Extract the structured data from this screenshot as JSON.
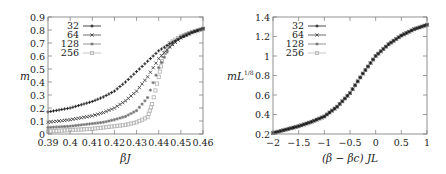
{
  "chart_data": [
    {
      "type": "scatter",
      "title": "",
      "xlabel": "βJ",
      "ylabel": "m",
      "xlim": [
        0.39,
        0.46
      ],
      "ylim": [
        0,
        0.9
      ],
      "xticks": [
        0.39,
        0.4,
        0.41,
        0.42,
        0.43,
        0.44,
        0.45,
        0.46
      ],
      "xtick_labels": [
        "0.39",
        "0.4",
        "0.41",
        "0.42",
        "0.43",
        "0.44",
        "0.45",
        "0.46"
      ],
      "yticks": [
        0,
        0.1,
        0.2,
        0.3,
        0.4,
        0.5,
        0.6,
        0.7,
        0.8,
        0.9
      ],
      "ytick_labels": [
        "0",
        "0.1",
        "0.2",
        "0.3",
        "0.4",
        "0.5",
        "0.6",
        "0.7",
        "0.8",
        "0.9"
      ],
      "grid": false,
      "legend_position": "upper left",
      "series": [
        {
          "name": "32",
          "marker": "+",
          "color": "#1a1a1a",
          "x": [
            0.39,
            0.395,
            0.4,
            0.405,
            0.41,
            0.415,
            0.42,
            0.425,
            0.43,
            0.435,
            0.44,
            0.445,
            0.45,
            0.455,
            0.46
          ],
          "y": [
            0.17,
            0.185,
            0.2,
            0.225,
            0.25,
            0.285,
            0.33,
            0.4,
            0.48,
            0.56,
            0.64,
            0.695,
            0.74,
            0.78,
            0.81
          ]
        },
        {
          "name": "64",
          "marker": "x",
          "color": "#444444",
          "x": [
            0.39,
            0.395,
            0.4,
            0.405,
            0.41,
            0.415,
            0.42,
            0.425,
            0.43,
            0.435,
            0.44,
            0.445,
            0.45,
            0.455,
            0.46
          ],
          "y": [
            0.09,
            0.1,
            0.11,
            0.125,
            0.14,
            0.165,
            0.2,
            0.255,
            0.33,
            0.44,
            0.58,
            0.67,
            0.74,
            0.78,
            0.81
          ]
        },
        {
          "name": "128",
          "marker": "*",
          "color": "#777777",
          "x": [
            0.39,
            0.395,
            0.4,
            0.405,
            0.41,
            0.415,
            0.42,
            0.425,
            0.43,
            0.435,
            0.44,
            0.445,
            0.45,
            0.455,
            0.46
          ],
          "y": [
            0.05,
            0.055,
            0.06,
            0.07,
            0.08,
            0.09,
            0.11,
            0.135,
            0.18,
            0.28,
            0.51,
            0.67,
            0.75,
            0.785,
            0.81
          ]
        },
        {
          "name": "256",
          "marker": "square",
          "color": "#b8b8b8",
          "x": [
            0.39,
            0.395,
            0.4,
            0.405,
            0.41,
            0.415,
            0.42,
            0.425,
            0.43,
            0.435,
            0.437,
            0.44,
            0.442,
            0.445,
            0.45,
            0.455,
            0.46
          ],
          "y": [
            0.02,
            0.025,
            0.03,
            0.035,
            0.04,
            0.05,
            0.06,
            0.07,
            0.09,
            0.13,
            0.23,
            0.44,
            0.6,
            0.7,
            0.75,
            0.785,
            0.81
          ]
        }
      ]
    },
    {
      "type": "scatter",
      "title": "",
      "xlabel": "(β − βc) JL",
      "ylabel": "mL",
      "ylabel_superscript": "1/8",
      "xlim": [
        -2,
        1
      ],
      "ylim": [
        0.2,
        1.4
      ],
      "xticks": [
        -2,
        -1.5,
        -1,
        -0.5,
        0,
        0.5,
        1
      ],
      "xtick_labels": [
        "−2",
        "−1.5",
        "−1",
        "−0.5",
        "0",
        "0.5",
        "1"
      ],
      "yticks": [
        0.2,
        0.4,
        0.6,
        0.8,
        1.0,
        1.2,
        1.4
      ],
      "ytick_labels": [
        "0.2",
        "0.4",
        "0.6",
        "0.8",
        "1",
        "1.2",
        "1.4"
      ],
      "grid": false,
      "legend_position": "upper left",
      "series": [
        {
          "name": "32",
          "marker": "+",
          "color": "#1a1a1a",
          "x": [
            -2,
            -1.75,
            -1.5,
            -1.25,
            -1,
            -0.75,
            -0.5,
            -0.25,
            0,
            0.25,
            0.5,
            0.75,
            1
          ],
          "y": [
            0.21,
            0.245,
            0.28,
            0.325,
            0.38,
            0.48,
            0.62,
            0.82,
            1.0,
            1.12,
            1.21,
            1.275,
            1.32
          ]
        },
        {
          "name": "64",
          "marker": "x",
          "color": "#444444",
          "x": [
            -2,
            -1.75,
            -1.5,
            -1.25,
            -1,
            -0.75,
            -0.5,
            -0.25,
            0,
            0.25,
            0.5,
            0.75,
            1
          ],
          "y": [
            0.21,
            0.245,
            0.28,
            0.325,
            0.38,
            0.48,
            0.62,
            0.82,
            1.0,
            1.12,
            1.21,
            1.275,
            1.32
          ]
        },
        {
          "name": "128",
          "marker": "*",
          "color": "#777777",
          "x": [
            -2,
            -1.75,
            -1.5,
            -1.25,
            -1,
            -0.75,
            -0.5,
            -0.25,
            0,
            0.25,
            0.5,
            0.75,
            1
          ],
          "y": [
            0.21,
            0.245,
            0.28,
            0.325,
            0.38,
            0.48,
            0.62,
            0.82,
            1.0,
            1.12,
            1.21,
            1.275,
            1.32
          ]
        },
        {
          "name": "256",
          "marker": "square",
          "color": "#b8b8b8",
          "x": [
            -2,
            -1.75,
            -1.5,
            -1.25,
            -1,
            -0.75,
            -0.5,
            -0.25,
            0,
            0.25,
            0.5,
            0.75,
            1
          ],
          "y": [
            0.21,
            0.245,
            0.28,
            0.325,
            0.38,
            0.48,
            0.62,
            0.82,
            1.0,
            1.12,
            1.21,
            1.275,
            1.32
          ]
        }
      ]
    }
  ],
  "layout": {
    "panels": [
      {
        "frame": {
          "left": 48,
          "top": 17,
          "right": 203,
          "bottom": 134
        }
      },
      {
        "frame": {
          "left": 50,
          "top": 17,
          "right": 204,
          "bottom": 134
        }
      }
    ]
  }
}
